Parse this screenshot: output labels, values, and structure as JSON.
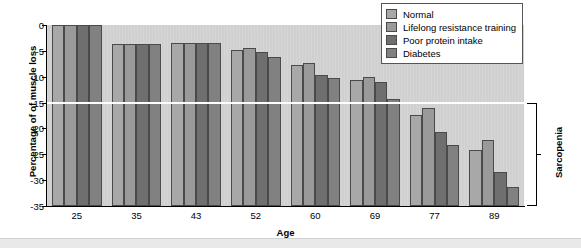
{
  "chart_data": {
    "type": "bar",
    "title": "",
    "xlabel": "Age",
    "ylabel": "Percentage of of muscle loss",
    "categories": [
      "25",
      "35",
      "43",
      "52",
      "60",
      "69",
      "77",
      "89"
    ],
    "ylim": [
      -35,
      0
    ],
    "ytick_labels": [
      "0",
      "-5",
      "-10",
      "-15",
      "-20",
      "-25",
      "-30",
      "-35"
    ],
    "ytick_values": [
      0,
      -5,
      -10,
      -15,
      -20,
      -25,
      -30,
      -35
    ],
    "grid": false,
    "legend_position": "top-right",
    "series": [
      {
        "name": "Normal",
        "color": "#a8a8a8",
        "values": [
          0,
          -3.6,
          -3.4,
          -4.8,
          -7.8,
          -10.6,
          -17.4,
          -24.2
        ]
      },
      {
        "name": "Lifelong resistance training",
        "color": "#9a9a9a",
        "values": [
          0,
          -3.6,
          -3.4,
          -4.5,
          -7.4,
          -10.0,
          -16.0,
          -22.3
        ]
      },
      {
        "name": "Poor protein intake",
        "color": "#6f6f6f",
        "values": [
          0,
          -3.6,
          -3.4,
          -5.3,
          -9.6,
          -11.0,
          -20.7,
          -28.4
        ]
      },
      {
        "name": "Diabetes",
        "color": "#818181",
        "values": [
          0,
          -3.6,
          -3.4,
          -6.1,
          -10.2,
          -14.3,
          -23.2,
          -31.4
        ]
      }
    ],
    "reference_line": {
      "value": -15,
      "color": "#ffffff"
    },
    "annotations": [
      {
        "name": "sarcopenia-bracket",
        "label": "Sarcopenia",
        "from": -15,
        "to": -35,
        "position": "right"
      }
    ],
    "plot_background": "#d0d0d0",
    "figure_background": "#ffffff"
  }
}
